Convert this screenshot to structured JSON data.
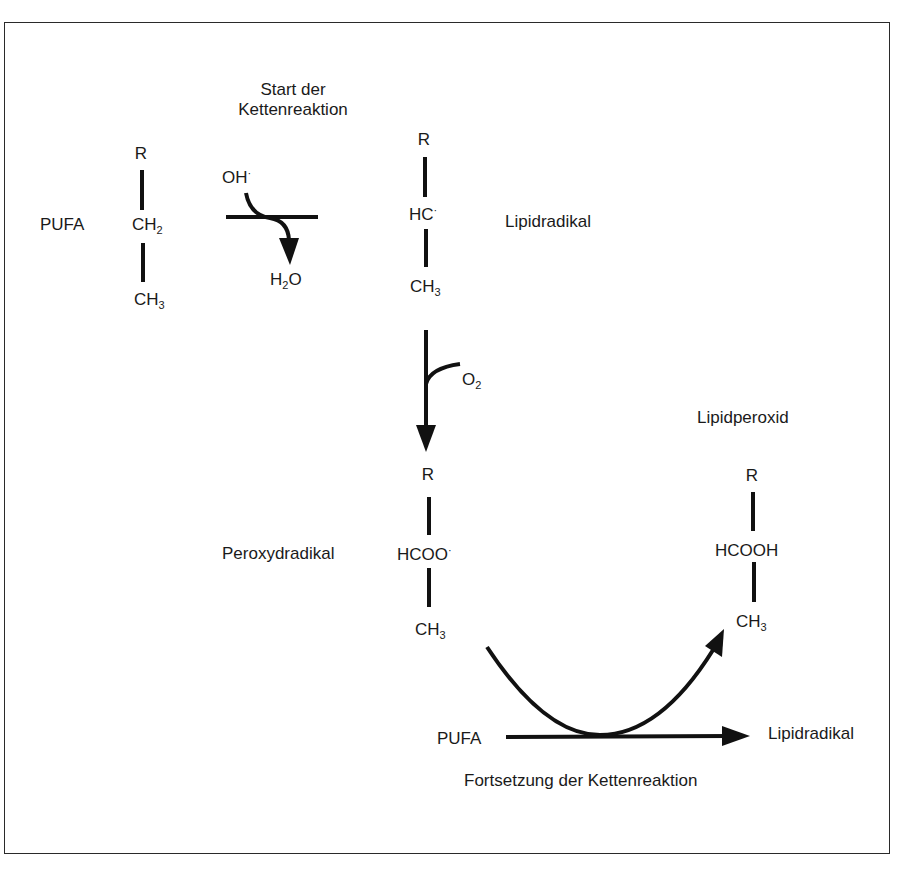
{
  "diagram": {
    "title_start": [
      "Start der",
      "Kettenreaktion"
    ],
    "title_continue": "Fortsetzung der Kettenreaktion",
    "molecules": {
      "pufa": {
        "label": "PUFA",
        "top": "R",
        "middle_main": "CH",
        "middle_sub": "2",
        "bottom_main": "CH",
        "bottom_sub": "3"
      },
      "lipid_radical": {
        "label": "Lipidradikal",
        "top": "R",
        "middle_main": "HC",
        "middle_sup": "·",
        "bottom_main": "CH",
        "bottom_sub": "3"
      },
      "peroxyl_radical": {
        "label": "Peroxydradikal",
        "top": "R",
        "middle_main": "HCOO",
        "middle_sup": "·",
        "bottom_main": "CH",
        "bottom_sub": "3"
      },
      "lipid_peroxide": {
        "label": "Lipidperoxid",
        "top": "R",
        "middle_main": "HCOOH",
        "bottom_main": "CH",
        "bottom_sub": "3"
      }
    },
    "reagents": {
      "oh_main": "OH",
      "oh_sup": "·",
      "h2o_a": "H",
      "h2o_sub": "2",
      "h2o_b": "O",
      "o2_main": "O",
      "o2_sub": "2"
    },
    "propagation": {
      "reactant": "PUFA",
      "product": "Lipidradikal"
    },
    "colors": {
      "ink": "#111111",
      "background": "#ffffff",
      "frame": "#2a2a2a"
    }
  }
}
